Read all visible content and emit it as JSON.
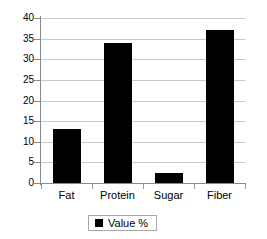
{
  "chart_data": {
    "type": "bar",
    "title": "",
    "xlabel": "",
    "ylabel": "",
    "categories": [
      "Fat",
      "Protein",
      "Sugar",
      "Fiber"
    ],
    "series": [
      {
        "name": "Value %",
        "values": [
          13,
          34,
          2.5,
          37
        ],
        "color": "#000000"
      }
    ],
    "values": [
      13,
      34,
      2.5,
      37
    ],
    "ylim": [
      0,
      40
    ],
    "ytick_step": 5,
    "yticks": [
      0,
      5,
      10,
      15,
      20,
      25,
      30,
      35,
      40
    ],
    "ytick_labels": [
      "0",
      "5",
      "10",
      "15",
      "20",
      "25",
      "30",
      "35",
      "40"
    ],
    "grid": true,
    "grid_axis": "y",
    "grid_color": "#c9c9c9",
    "axis_color": "#8a8a8a",
    "legend": {
      "position": "bottom",
      "entries": [
        {
          "label": "Value %",
          "color": "#000000",
          "marker": "square-marker"
        }
      ]
    }
  }
}
